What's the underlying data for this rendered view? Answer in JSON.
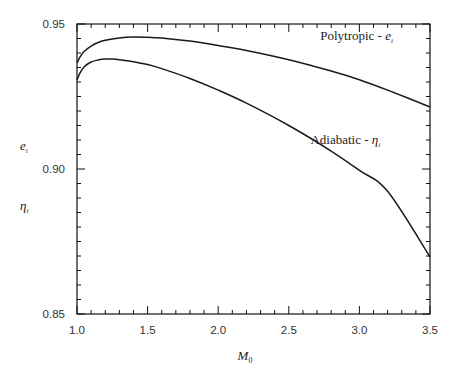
{
  "chart_data": {
    "type": "line",
    "title": "",
    "xlabel": "M0",
    "xlabel_main": "M",
    "xlabel_sub": "0",
    "ylabel_lines": [
      {
        "main": "e",
        "sub": "i"
      },
      {
        "main": "η",
        "sub": "i"
      }
    ],
    "xlim": [
      1.0,
      3.5
    ],
    "ylim": [
      0.85,
      0.95
    ],
    "x_ticks": [
      1.0,
      1.5,
      2.0,
      2.5,
      3.0,
      3.5
    ],
    "x_tick_labels": [
      "1.0",
      "1.5",
      "2.0",
      "2.5",
      "3.0",
      "3.5"
    ],
    "x_minor_step": 0.1,
    "y_ticks": [
      0.85,
      0.9,
      0.95
    ],
    "y_tick_labels": [
      "0.85",
      "0.90",
      "0.95"
    ],
    "y_minor_step": 0.005,
    "grid": false,
    "legend": "inline labels",
    "series": [
      {
        "name": "Polytropic - e_i",
        "label_main": "Polytropic - ",
        "label_symbol": "e",
        "label_sub": "i",
        "label_pos": [
          2.98,
          0.9445
        ],
        "x": [
          1.0,
          1.02,
          1.05,
          1.1,
          1.15,
          1.2,
          1.3,
          1.4,
          1.5,
          1.6,
          1.8,
          2.0,
          2.2,
          2.5,
          2.8,
          3.0,
          3.2,
          3.5
        ],
        "values": [
          0.9366,
          0.9385,
          0.9405,
          0.9424,
          0.9436,
          0.9444,
          0.9452,
          0.9455,
          0.9454,
          0.9452,
          0.9441,
          0.9426,
          0.9409,
          0.9377,
          0.9338,
          0.9308,
          0.9272,
          0.9214
        ]
      },
      {
        "name": "Adiabatic - η_i",
        "label_main": "Adiabatic - ",
        "label_symbol": "η",
        "label_sub": "i",
        "label_pos": [
          2.9,
          0.9085
        ],
        "x": [
          1.0,
          1.02,
          1.05,
          1.1,
          1.15,
          1.2,
          1.25,
          1.3,
          1.4,
          1.5,
          1.6,
          1.8,
          2.0,
          2.2,
          2.5,
          2.8,
          3.0,
          3.2,
          3.5
        ],
        "values": [
          0.9307,
          0.933,
          0.9352,
          0.9369,
          0.9376,
          0.9379,
          0.9379,
          0.9377,
          0.937,
          0.936,
          0.9346,
          0.9312,
          0.9272,
          0.9227,
          0.915,
          0.9062,
          0.8995,
          0.8923,
          0.8697
        ]
      }
    ]
  }
}
